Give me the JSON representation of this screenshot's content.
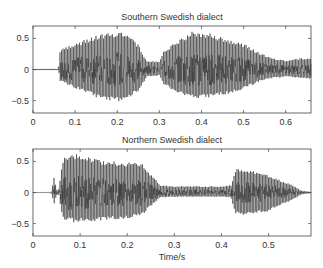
{
  "chart_data": [
    {
      "type": "line",
      "title": "Southern Swedish dialect",
      "xlabel": "",
      "ylabel": "",
      "xlim": [
        0,
        0.66
      ],
      "ylim": [
        -0.7,
        0.7
      ],
      "xticks": [
        0,
        0.1,
        0.2,
        0.3,
        0.4,
        0.5,
        0.6
      ],
      "xtick_labels": [
        "0",
        "0.1",
        "0.2",
        "0.3",
        "0.4",
        "0.5",
        "0.6"
      ],
      "yticks": [
        -0.5,
        0,
        0.5
      ],
      "ytick_labels": [
        "-0.5",
        "0",
        "0.5"
      ],
      "grid": false,
      "description": "Speech waveform; silence until ~0.06 s, first voiced syllable 0.06-0.26 s peaking ~0.6 near 0.2 s, brief low segment ~0.27-0.30 s, second syllable 0.30-0.53 s peaking ~0.6 near 0.38 s, decaying tail to 0.66 s",
      "envelope": {
        "t": [
          0,
          0.06,
          0.065,
          0.1,
          0.15,
          0.2,
          0.22,
          0.25,
          0.27,
          0.3,
          0.31,
          0.35,
          0.38,
          0.42,
          0.46,
          0.5,
          0.53,
          0.56,
          0.6,
          0.66
        ],
        "pos": [
          0.01,
          0.01,
          0.35,
          0.42,
          0.55,
          0.62,
          0.62,
          0.4,
          0.15,
          0.12,
          0.3,
          0.5,
          0.62,
          0.58,
          0.5,
          0.42,
          0.3,
          0.2,
          0.15,
          0.2
        ],
        "neg": [
          -0.01,
          -0.01,
          -0.2,
          -0.3,
          -0.45,
          -0.52,
          -0.5,
          -0.35,
          -0.12,
          -0.1,
          -0.25,
          -0.4,
          -0.47,
          -0.45,
          -0.4,
          -0.32,
          -0.22,
          -0.15,
          -0.12,
          -0.15
        ]
      }
    },
    {
      "type": "line",
      "title": "Northern Swedish dialect",
      "xlabel": "Time/s",
      "ylabel": "",
      "xlim": [
        0,
        0.59
      ],
      "ylim": [
        -0.7,
        0.7
      ],
      "xticks": [
        0,
        0.1,
        0.2,
        0.3,
        0.4,
        0.5
      ],
      "xtick_labels": [
        "0",
        "0.1",
        "0.2",
        "0.3",
        "0.4",
        "0.5"
      ],
      "yticks": [
        -0.5,
        0,
        0.5
      ],
      "ytick_labels": [
        "-0.5",
        "0",
        "0.5"
      ],
      "grid": false,
      "description": "Speech waveform; short burst ~0.04-0.05 s, voiced syllable 0.06-0.25 s peaking ~0.65 near 0.08 s, low-amplitude segment 0.26-0.42 s, second syllable 0.43-0.57 s peaking ~0.4, decaying to zero",
      "envelope": {
        "t": [
          0,
          0.038,
          0.045,
          0.05,
          0.055,
          0.062,
          0.07,
          0.08,
          0.1,
          0.15,
          0.2,
          0.23,
          0.25,
          0.27,
          0.3,
          0.35,
          0.4,
          0.42,
          0.43,
          0.45,
          0.5,
          0.55,
          0.57,
          0.59
        ],
        "pos": [
          0.005,
          0.005,
          0.25,
          0.05,
          0.05,
          0.5,
          0.6,
          0.65,
          0.6,
          0.52,
          0.48,
          0.48,
          0.3,
          0.12,
          0.1,
          0.1,
          0.1,
          0.12,
          0.38,
          0.38,
          0.28,
          0.12,
          0.03,
          0.01
        ],
        "neg": [
          -0.005,
          -0.005,
          -0.18,
          -0.04,
          -0.04,
          -0.4,
          -0.45,
          -0.48,
          -0.48,
          -0.45,
          -0.42,
          -0.38,
          -0.22,
          -0.08,
          -0.07,
          -0.07,
          -0.07,
          -0.08,
          -0.35,
          -0.38,
          -0.3,
          -0.12,
          -0.03,
          -0.01
        ]
      }
    }
  ],
  "layout": {
    "axes": [
      {
        "left": 33,
        "top": 26,
        "right": 311,
        "bottom": 113
      },
      {
        "left": 33,
        "top": 149,
        "right": 311,
        "bottom": 236
      }
    ],
    "colors": {
      "waveform": "#3a3a3a",
      "axis": "#444444",
      "text": "#333333"
    }
  }
}
